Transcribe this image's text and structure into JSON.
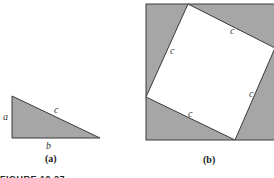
{
  "figure": {
    "caption": "FIGURE 10.27",
    "colors": {
      "fill": "#a6a6a6",
      "stroke": "#3a3a3a",
      "inner": "#ffffff"
    },
    "panel_a": {
      "label": "(a)",
      "side_labels": {
        "a": "a",
        "b": "b",
        "c": "c"
      }
    },
    "panel_b": {
      "label": "(b)",
      "side_labels": [
        "c",
        "c",
        "c",
        "c"
      ]
    }
  }
}
